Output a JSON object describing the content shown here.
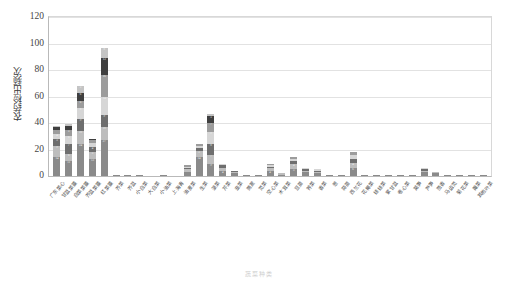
{
  "chart_data": {
    "type": "bar",
    "subtype": "stacked-column",
    "title": "",
    "xlabel": "",
    "ylabel": "农药检出频次",
    "ylim": [
      0,
      120
    ],
    "yticks": [
      0,
      20,
      40,
      60,
      80,
      100,
      120
    ],
    "grid": true,
    "legend_position": "none",
    "categories": [
      "广东菜心",
      "甘蓝菜薹",
      "白菜菜薹",
      "芥蓝菜薹",
      "红菜薹",
      "芥菜",
      "芥蓝",
      "小白菜",
      "大白菜",
      "小油菜",
      "上海青",
      "油麦菜",
      "生菜",
      "菠菜",
      "芹菜",
      "韭菜",
      "茼蒿",
      "苋菜",
      "空心菜",
      "木耳菜",
      "豆苗",
      "荠菜",
      "香菜",
      "葱",
      "蒜苗",
      "西兰花",
      "花椰菜",
      "娃娃菜",
      "紫甘蓝",
      "卷心菜",
      "莴笋",
      "芦笋",
      "茴香",
      "马齿苋",
      "菊花菜",
      "蕹菜",
      "其他叶菜"
    ],
    "values": [
      38,
      39,
      68,
      28,
      97,
      1,
      1,
      1,
      0,
      1,
      0,
      8,
      24,
      47,
      9,
      4,
      1,
      1,
      9,
      2,
      14,
      6,
      5,
      1,
      1,
      18,
      1,
      1,
      1,
      1,
      1,
      6,
      3,
      1,
      1,
      1,
      1
    ],
    "series": [
      {
        "name": "第1层",
        "values": [
          14,
          11,
          24,
          13,
          27,
          1,
          1,
          1,
          0,
          1,
          0,
          3,
          14,
          9,
          4,
          2,
          1,
          1,
          4,
          1,
          5,
          3,
          2,
          1,
          1,
          6,
          1,
          1,
          1,
          1,
          1,
          3,
          2,
          1,
          1,
          1,
          1
        ]
      },
      {
        "name": "第2层",
        "values": [
          9,
          6,
          10,
          5,
          10,
          0,
          0,
          0,
          0,
          0,
          0,
          2,
          5,
          7,
          2,
          1,
          0,
          0,
          2,
          1,
          4,
          1,
          1,
          0,
          0,
          4,
          0,
          0,
          0,
          0,
          0,
          1,
          1,
          0,
          0,
          0,
          0
        ]
      },
      {
        "name": "第3层",
        "values": [
          5,
          7,
          9,
          4,
          9,
          0,
          0,
          0,
          0,
          0,
          0,
          1,
          2,
          8,
          2,
          1,
          0,
          0,
          1,
          0,
          2,
          1,
          1,
          0,
          0,
          3,
          0,
          0,
          0,
          0,
          0,
          1,
          0,
          0,
          0,
          0,
          0
        ]
      },
      {
        "name": "第4层",
        "values": [
          4,
          6,
          8,
          3,
          14,
          0,
          0,
          0,
          0,
          0,
          0,
          1,
          2,
          9,
          1,
          0,
          0,
          0,
          1,
          0,
          2,
          1,
          1,
          0,
          0,
          3,
          0,
          0,
          0,
          0,
          0,
          1,
          0,
          0,
          0,
          0,
          0
        ]
      },
      {
        "name": "第5层",
        "values": [
          3,
          5,
          6,
          2,
          16,
          0,
          0,
          0,
          0,
          0,
          0,
          1,
          1,
          7,
          0,
          0,
          0,
          0,
          1,
          0,
          1,
          0,
          0,
          0,
          0,
          2,
          0,
          0,
          0,
          0,
          0,
          0,
          0,
          0,
          0,
          0,
          0
        ]
      },
      {
        "name": "第6层",
        "values": [
          2,
          3,
          6,
          1,
          13,
          0,
          0,
          0,
          0,
          0,
          0,
          0,
          0,
          5,
          0,
          0,
          0,
          0,
          0,
          0,
          0,
          0,
          0,
          0,
          0,
          0,
          0,
          0,
          0,
          0,
          0,
          0,
          0,
          0,
          0,
          0,
          0
        ]
      },
      {
        "name": "第7层",
        "values": [
          1,
          1,
          5,
          0,
          8,
          0,
          0,
          0,
          0,
          0,
          0,
          0,
          0,
          2,
          0,
          0,
          0,
          0,
          0,
          0,
          0,
          0,
          0,
          0,
          0,
          0,
          0,
          0,
          0,
          0,
          0,
          0,
          0,
          0,
          0,
          0,
          0
        ]
      }
    ],
    "segment_colors": [
      "#8a8a8a",
      "#bdbdbd",
      "#6e6e6e",
      "#d6d6d6",
      "#9c9c9c",
      "#3f3f3f",
      "#c4c4c4"
    ]
  },
  "axis": {
    "y_tick_labels": [
      "120",
      "100",
      "80",
      "60",
      "40",
      "20",
      "0"
    ]
  },
  "caption": {
    "text": "蔬菜种类"
  }
}
